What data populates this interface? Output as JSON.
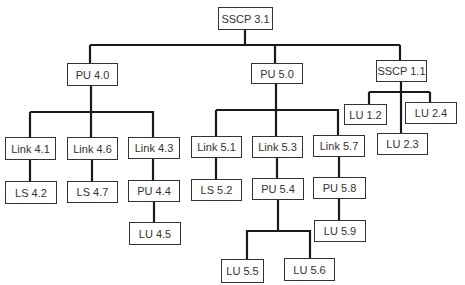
{
  "diagram": {
    "type": "tree",
    "nodes": [
      {
        "id": "sscp31",
        "label": "SSCP 3.1",
        "x": 218,
        "y": 7,
        "w": 55,
        "h": 23
      },
      {
        "id": "pu40",
        "label": "PU 4.0",
        "x": 67,
        "y": 63,
        "w": 51,
        "h": 23
      },
      {
        "id": "pu50",
        "label": "PU 5.0",
        "x": 251,
        "y": 63,
        "w": 52,
        "h": 21
      },
      {
        "id": "sscp11",
        "label": "SSCP 1.1",
        "x": 376,
        "y": 60,
        "w": 51,
        "h": 22
      },
      {
        "id": "link41",
        "label": "Link 4.1",
        "x": 5,
        "y": 137,
        "w": 51,
        "h": 23
      },
      {
        "id": "link46",
        "label": "Link 4.6",
        "x": 67,
        "y": 137,
        "w": 51,
        "h": 23
      },
      {
        "id": "link43",
        "label": "Link 4.3",
        "x": 128,
        "y": 137,
        "w": 52,
        "h": 22
      },
      {
        "id": "link51",
        "label": "Link 5.1",
        "x": 191,
        "y": 136,
        "w": 51,
        "h": 22
      },
      {
        "id": "link53",
        "label": "Link 5.3",
        "x": 252,
        "y": 136,
        "w": 51,
        "h": 22
      },
      {
        "id": "link57",
        "label": "Link 5.7",
        "x": 313,
        "y": 135,
        "w": 52,
        "h": 22
      },
      {
        "id": "lu12",
        "label": "LU 1.2",
        "x": 344,
        "y": 104,
        "w": 43,
        "h": 21
      },
      {
        "id": "lu24",
        "label": "LU 2.4",
        "x": 405,
        "y": 102,
        "w": 52,
        "h": 22
      },
      {
        "id": "lu23",
        "label": "LU 2.3",
        "x": 377,
        "y": 133,
        "w": 51,
        "h": 22
      },
      {
        "id": "ls42",
        "label": "LS 4.2",
        "x": 5,
        "y": 181,
        "w": 52,
        "h": 23
      },
      {
        "id": "ls47",
        "label": "LS 4.7",
        "x": 67,
        "y": 181,
        "w": 51,
        "h": 22
      },
      {
        "id": "pu44",
        "label": "PU 4.4",
        "x": 128,
        "y": 180,
        "w": 52,
        "h": 22
      },
      {
        "id": "ls52",
        "label": "LS 5.2",
        "x": 191,
        "y": 179,
        "w": 51,
        "h": 22
      },
      {
        "id": "pu54",
        "label": "PU 5.4",
        "x": 252,
        "y": 178,
        "w": 52,
        "h": 22
      },
      {
        "id": "pu58",
        "label": "PU 5.8",
        "x": 313,
        "y": 177,
        "w": 53,
        "h": 22
      },
      {
        "id": "lu45",
        "label": "LU 4.5",
        "x": 129,
        "y": 222,
        "w": 52,
        "h": 23
      },
      {
        "id": "lu59",
        "label": "LU 5.9",
        "x": 314,
        "y": 220,
        "w": 52,
        "h": 22
      },
      {
        "id": "lu55",
        "label": "LU 5.5",
        "x": 221,
        "y": 259,
        "w": 43,
        "h": 24
      },
      {
        "id": "lu56",
        "label": "LU 5.6",
        "x": 284,
        "y": 258,
        "w": 51,
        "h": 23
      }
    ],
    "edges": [
      [
        "sscp31",
        "pu40"
      ],
      [
        "sscp31",
        "pu50"
      ],
      [
        "sscp31",
        "sscp11"
      ],
      [
        "pu40",
        "link41"
      ],
      [
        "pu40",
        "link46"
      ],
      [
        "pu40",
        "link43"
      ],
      [
        "pu50",
        "link51"
      ],
      [
        "pu50",
        "link53"
      ],
      [
        "pu50",
        "link57"
      ],
      [
        "sscp11",
        "lu12"
      ],
      [
        "sscp11",
        "lu23"
      ],
      [
        "sscp11",
        "lu24"
      ],
      [
        "link41",
        "ls42"
      ],
      [
        "link46",
        "ls47"
      ],
      [
        "link43",
        "pu44"
      ],
      [
        "link51",
        "ls52"
      ],
      [
        "link53",
        "pu54"
      ],
      [
        "link57",
        "pu58"
      ],
      [
        "pu44",
        "lu45"
      ],
      [
        "pu58",
        "lu59"
      ],
      [
        "pu54",
        "lu55"
      ],
      [
        "pu54",
        "lu56"
      ]
    ]
  },
  "labels": {
    "sscp31": "SSCP 3.1",
    "pu40": "PU 4.0",
    "pu50": "PU 5.0",
    "sscp11": "SSCP 1.1",
    "link41": "Link 4.1",
    "link46": "Link 4.6",
    "link43": "Link 4.3",
    "link51": "Link 5.1",
    "link53": "Link 5.3",
    "link57": "Link 5.7",
    "lu12": "LU 1.2",
    "lu24": "LU 2.4",
    "lu23": "LU 2.3",
    "ls42": "LS 4.2",
    "ls47": "LS 4.7",
    "pu44": "PU 4.4",
    "ls52": "LS 5.2",
    "pu54": "PU 5.4",
    "pu58": "PU 5.8",
    "lu45": "LU 4.5",
    "lu59": "LU 5.9",
    "lu55": "LU 5.5",
    "lu56": "LU 5.6"
  },
  "colors": {
    "line": "#1a1a1a",
    "border": "#333333",
    "text": "#333333",
    "background": "#ffffff"
  }
}
